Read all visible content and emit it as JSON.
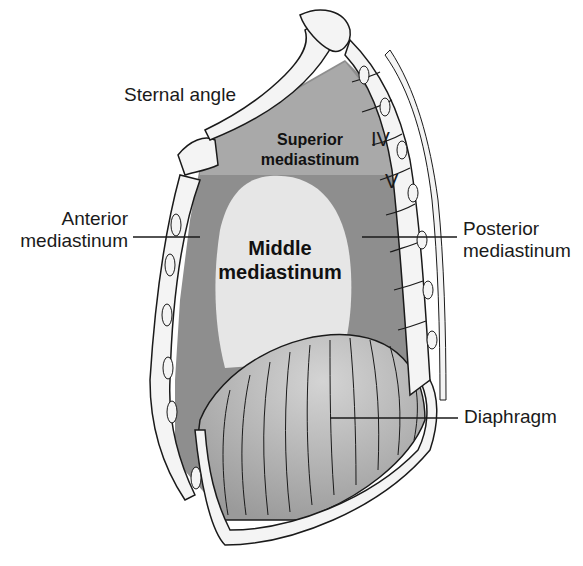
{
  "figure": {
    "labels": {
      "sternal_angle": "Sternal angle",
      "superior_line1": "Superior",
      "superior_line2": "mediastinum",
      "anterior_line1": "Anterior",
      "anterior_line2": "mediastinum",
      "middle_line1": "Middle",
      "middle_line2": "mediastinum",
      "posterior_line1": "Posterior",
      "posterior_line2": "mediastinum",
      "diaphragm": "Diaphragm",
      "vertebra_iv": "IV",
      "vertebra_v": "V"
    },
    "colors": {
      "superior_region": "#a9a9a9",
      "anterior_posterior_region": "#8e8e8e",
      "middle_region": "#e6e6e6",
      "diaphragm": "#b8b8b8",
      "bone": "#f4f4f4",
      "outline": "#1a1a1a"
    }
  }
}
